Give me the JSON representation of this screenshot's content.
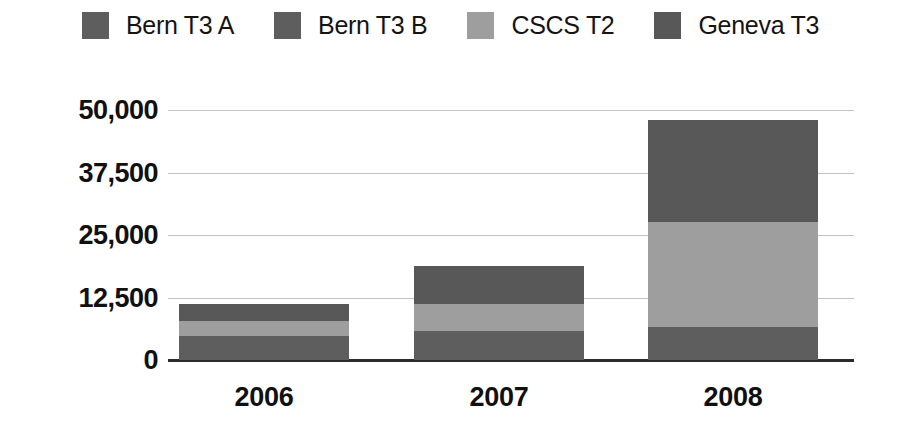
{
  "chart_data": {
    "type": "bar",
    "subtype": "stacked-bar",
    "title": "",
    "xlabel": "",
    "ylabel": "",
    "categories": [
      "2006",
      "2007",
      "2008"
    ],
    "series": [
      {
        "name": "Bern T3 A",
        "color": "#5e5e5e",
        "values": [
          2400,
          2900,
          3300
        ]
      },
      {
        "name": "Bern T3 B",
        "color": "#5e5e5e",
        "values": [
          2400,
          2900,
          3300
        ]
      },
      {
        "name": "CSCS T2",
        "color": "#9e9e9e",
        "values": [
          3000,
          5400,
          21000
        ]
      },
      {
        "name": "Geneva T3",
        "color": "#585858",
        "values": [
          3400,
          7600,
          20400
        ]
      }
    ],
    "totals": [
      11200,
      18800,
      48000
    ],
    "ylim": [
      0,
      50000
    ],
    "yticks": [
      0,
      12500,
      25000,
      37500,
      50000
    ],
    "ytick_labels": [
      "0",
      "12,500",
      "25,000",
      "37,500",
      "50,000"
    ],
    "grid": true,
    "legend_position": "top"
  },
  "legend": {
    "items": [
      {
        "label": "Bern T3 A",
        "color": "#5e5e5e"
      },
      {
        "label": "Bern T3 B",
        "color": "#5e5e5e"
      },
      {
        "label": "CSCS T2",
        "color": "#9e9e9e"
      },
      {
        "label": "Geneva T3",
        "color": "#585858"
      }
    ]
  },
  "axes": {
    "y_labels": [
      "50,000",
      "37,500",
      "25,000",
      "12,500",
      "0"
    ],
    "x_labels": [
      "2006",
      "2007",
      "2008"
    ]
  },
  "colors": {
    "bern_t3_a": "#5e5e5e",
    "bern_t3_b": "#5e5e5e",
    "cscs_t2": "#9e9e9e",
    "geneva_t3": "#585858",
    "gridline": "#c2c2c2",
    "axis": "#2b2b2b",
    "text": "#101010",
    "background": "#ffffff"
  }
}
